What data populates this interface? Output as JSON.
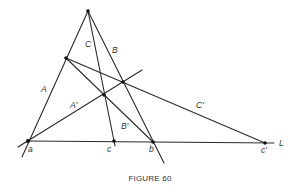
{
  "caption": "FIGURE 60",
  "labels": {
    "A": "A",
    "B": "B",
    "C": "C",
    "A_prime": "A'",
    "B_prime": "B'",
    "C_prime": "C'",
    "a": "a",
    "b": "b",
    "c": "c",
    "c_prime": "c'",
    "L": "L"
  },
  "points": {
    "apex": [
      88,
      11
    ],
    "a": [
      28,
      141
    ],
    "c": [
      114,
      141
    ],
    "b": [
      153,
      142
    ],
    "c_prime": [
      265,
      143
    ],
    "on_A": [
      66,
      58
    ],
    "on_B": [
      123,
      82
    ],
    "on_C": [
      104,
      95
    ]
  },
  "colors": {
    "line": "#2b2b2b",
    "point": "#111111",
    "text": "#333333",
    "background": "#ffffff"
  }
}
